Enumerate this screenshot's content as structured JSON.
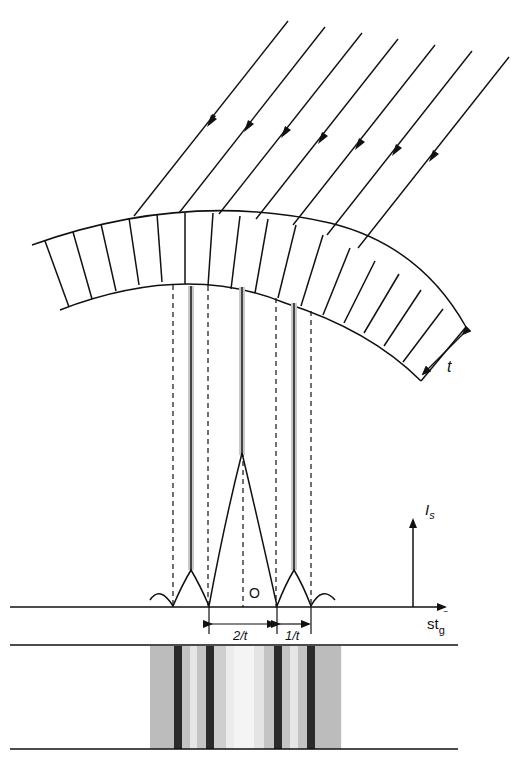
{
  "diagram": {
    "labels": {
      "thickness": "t",
      "intensity_axis": "I",
      "intensity_subscript": "s",
      "origin": "O",
      "x_axis_main": "st",
      "x_axis_subscript": "g",
      "x_axis_bar": "‾",
      "spacing_central": "2/t",
      "spacing_side": "1/t"
    },
    "elements": {
      "incident_rays": 7,
      "foil_segments": 17,
      "subsidiary_peaks": 2,
      "dark_fringes": 4
    },
    "colors": {
      "line": "#111111",
      "fringe_dark": "#2a2a2a",
      "fringe_mid": "#bdbdbd",
      "fringe_light": "#e8e8e8"
    }
  }
}
